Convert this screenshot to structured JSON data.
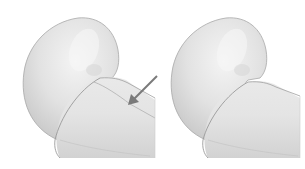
{
  "figures": [
    {
      "id": "left",
      "description": "Pipe elbow with visible seam line",
      "has_arrow": true,
      "has_seam": true
    },
    {
      "id": "right",
      "description": "Pipe elbow without seam line",
      "has_arrow": false,
      "has_seam": false
    }
  ],
  "colors": {
    "background": "#ffffff",
    "surface_light": "#eeeeee",
    "surface_mid": "#dcdcdc",
    "surface_shadow": "#c8c8c8",
    "outline": "#9a9a9a",
    "arrow": "#7a7a7a"
  }
}
